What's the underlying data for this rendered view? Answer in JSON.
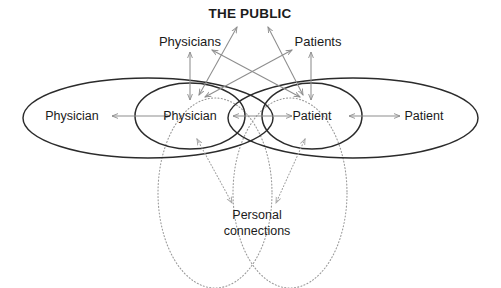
{
  "diagram": {
    "title": "THE PUBLIC",
    "canvas": {
      "width": 501,
      "height": 288,
      "background": "#ffffff"
    },
    "colors": {
      "text": "#1b1b1b",
      "solid_ellipse_stroke": "#2b2b2b",
      "dotted_ellipse_stroke": "#9a9a9a",
      "solid_arrow_stroke": "#8d8d8d",
      "dotted_arrow_stroke": "#a2a2a2"
    },
    "labels": {
      "public": "THE PUBLIC",
      "physicians_group": "Physicians",
      "patients_group": "Patients",
      "physician_outer": "Physician",
      "physician_inner": "Physician",
      "patient_inner": "Patient",
      "patient_outer": "Patient",
      "personal_connections_line1": "Personal",
      "personal_connections_line2": "connections"
    },
    "nodes": [
      {
        "name": "physician-outer",
        "label": "Physician",
        "x": 72,
        "y": 118,
        "shape": "ellipse-large-solid"
      },
      {
        "name": "physician-inner",
        "label": "Physician",
        "x": 190,
        "y": 118,
        "shape": "ellipse-small-solid"
      },
      {
        "name": "patient-inner",
        "label": "Patient",
        "x": 312,
        "y": 118,
        "shape": "ellipse-small-solid"
      },
      {
        "name": "patient-outer",
        "label": "Patient",
        "x": 424,
        "y": 118,
        "shape": "ellipse-large-solid"
      },
      {
        "name": "physicians-group",
        "label": "Physicians",
        "x": 190,
        "y": 43,
        "shape": "text-only"
      },
      {
        "name": "patients-group",
        "label": "Patients",
        "x": 318,
        "y": 43,
        "shape": "text-only"
      },
      {
        "name": "the-public",
        "label": "THE PUBLIC",
        "x": 250,
        "y": 17,
        "shape": "text-only"
      },
      {
        "name": "personal-connections",
        "label": "Personal connections",
        "x": 257,
        "y": 222,
        "shape": "text-only"
      }
    ],
    "connections": [
      {
        "from": "physician-outer",
        "to": "physician-inner",
        "style": "solid",
        "arrows": "both"
      },
      {
        "from": "physician-inner",
        "to": "patient-inner",
        "style": "solid",
        "arrows": "both"
      },
      {
        "from": "patient-inner",
        "to": "patient-outer",
        "style": "solid",
        "arrows": "both"
      },
      {
        "from": "physicians-group",
        "to": "physician-inner",
        "style": "solid",
        "arrows": "both"
      },
      {
        "from": "patients-group",
        "to": "patient-inner",
        "style": "solid",
        "arrows": "both"
      },
      {
        "from": "the-public",
        "to": "physician-inner",
        "style": "solid",
        "arrows": "both"
      },
      {
        "from": "the-public",
        "to": "patient-inner",
        "style": "solid",
        "arrows": "both"
      },
      {
        "from": "physicians-group",
        "to": "patient-inner",
        "style": "solid",
        "arrows": "both"
      },
      {
        "from": "patients-group",
        "to": "physician-inner",
        "style": "solid",
        "arrows": "both"
      },
      {
        "from": "personal-connections",
        "to": "physician-inner",
        "style": "dotted",
        "arrows": "both"
      },
      {
        "from": "personal-connections",
        "to": "patient-inner",
        "style": "dotted",
        "arrows": "both"
      }
    ]
  }
}
